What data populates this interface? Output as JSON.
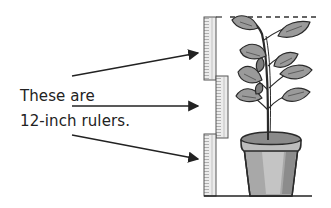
{
  "caption": {
    "line1": "These are",
    "line2": "12-inch rulers."
  },
  "figure": {
    "ruler_count": 3,
    "ruler_length_label": "12-inch",
    "arrows": 3,
    "colors": {
      "outline": "#2a2a2a",
      "ruler_fill": "#e8e8e8",
      "ruler_edge": "#6e6e6e",
      "leaf_fill": "#9a9a9a",
      "pot_fill": "#a8a8a8",
      "pot_rim": "#bdbdbd",
      "soil": "#8a8a8a",
      "arrow": "#222222"
    }
  }
}
